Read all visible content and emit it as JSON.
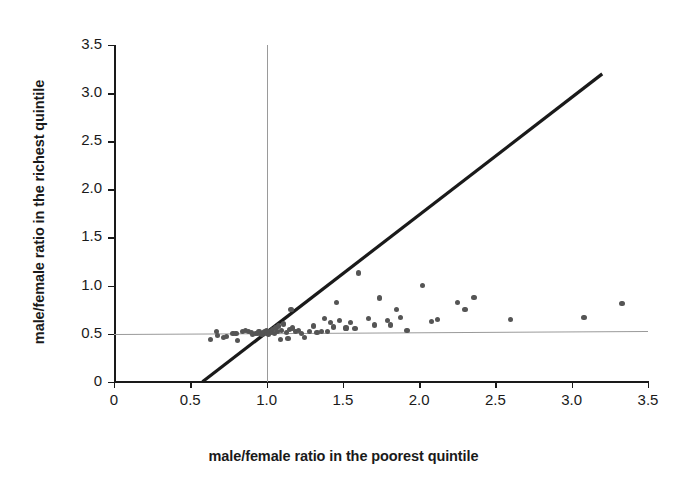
{
  "chart_data": {
    "type": "scatter",
    "title": "",
    "xlabel": "male/female ratio in the poorest quintile",
    "ylabel": "male/female ratio in the richest quintile",
    "xlim": [
      0,
      3.5
    ],
    "ylim": [
      0,
      3.5
    ],
    "xticks": [
      "0",
      "0.5",
      "1.0",
      "1.5",
      "2.0",
      "2.5",
      "3.0",
      "3.5"
    ],
    "xtick_values": [
      0,
      0.5,
      1.0,
      1.5,
      2.0,
      2.5,
      3.0,
      3.5
    ],
    "yticks": [
      "0",
      "0.5",
      "1.0",
      "1.5",
      "2.0",
      "2.5",
      "3.0",
      "3.5"
    ],
    "ytick_values": [
      0,
      0.5,
      1.0,
      1.5,
      2.0,
      2.5,
      3.0,
      3.5
    ],
    "grid": false,
    "legend": "none",
    "marker_color": "#555555",
    "marker_size": 5.2,
    "reference_lines": [
      {
        "name": "identity-line",
        "description": "y = x diagonal reference line",
        "type": "diagonal",
        "from": [
          0.58,
          0.0
        ],
        "to": [
          3.2,
          3.2
        ],
        "color": "#1a1a1a",
        "width": 3.2
      },
      {
        "name": "horizontal-reference",
        "description": "near-horizontal regression / reference line at about y = 0.5",
        "type": "horizontal",
        "from": [
          0.0,
          0.5
        ],
        "to": [
          3.5,
          0.53
        ],
        "color": "#9a9a9a",
        "width": 1
      },
      {
        "name": "vertical-reference",
        "description": "vertical reference line at x = 1.0",
        "type": "vertical",
        "x": 1.0,
        "from_y": 0.0,
        "to_y": 3.5,
        "color": "#9a9a9a",
        "width": 1
      }
    ],
    "points": [
      [
        0.63,
        0.44
      ],
      [
        0.67,
        0.52
      ],
      [
        0.68,
        0.48
      ],
      [
        0.72,
        0.46
      ],
      [
        0.74,
        0.47
      ],
      [
        0.78,
        0.5
      ],
      [
        0.8,
        0.5
      ],
      [
        0.81,
        0.43
      ],
      [
        0.84,
        0.52
      ],
      [
        0.86,
        0.53
      ],
      [
        0.88,
        0.52
      ],
      [
        0.9,
        0.51
      ],
      [
        0.91,
        0.49
      ],
      [
        0.93,
        0.5
      ],
      [
        0.94,
        0.5
      ],
      [
        0.95,
        0.52
      ],
      [
        0.96,
        0.5
      ],
      [
        0.97,
        0.49
      ],
      [
        0.98,
        0.51
      ],
      [
        0.99,
        0.52
      ],
      [
        1.0,
        0.5
      ],
      [
        1.0,
        0.53
      ],
      [
        1.01,
        0.49
      ],
      [
        1.02,
        0.52
      ],
      [
        1.03,
        0.51
      ],
      [
        1.04,
        0.54
      ],
      [
        1.05,
        0.5
      ],
      [
        1.06,
        0.56
      ],
      [
        1.07,
        0.52
      ],
      [
        1.08,
        0.58
      ],
      [
        1.09,
        0.44
      ],
      [
        1.1,
        0.53
      ],
      [
        1.11,
        0.6
      ],
      [
        1.13,
        0.51
      ],
      [
        1.14,
        0.45
      ],
      [
        1.15,
        0.54
      ],
      [
        1.16,
        0.75
      ],
      [
        1.17,
        0.56
      ],
      [
        1.19,
        0.52
      ],
      [
        1.21,
        0.53
      ],
      [
        1.23,
        0.5
      ],
      [
        1.25,
        0.46
      ],
      [
        1.28,
        0.52
      ],
      [
        1.31,
        0.58
      ],
      [
        1.33,
        0.51
      ],
      [
        1.36,
        0.52
      ],
      [
        1.38,
        0.66
      ],
      [
        1.4,
        0.52
      ],
      [
        1.42,
        0.62
      ],
      [
        1.44,
        0.57
      ],
      [
        1.46,
        0.82
      ],
      [
        1.48,
        0.64
      ],
      [
        1.52,
        0.56
      ],
      [
        1.55,
        0.62
      ],
      [
        1.58,
        0.55
      ],
      [
        1.6,
        1.13
      ],
      [
        1.67,
        0.66
      ],
      [
        1.71,
        0.59
      ],
      [
        1.74,
        0.87
      ],
      [
        1.79,
        0.64
      ],
      [
        1.81,
        0.59
      ],
      [
        1.85,
        0.75
      ],
      [
        1.88,
        0.67
      ],
      [
        1.92,
        0.53
      ],
      [
        2.02,
        1.0
      ],
      [
        2.08,
        0.63
      ],
      [
        2.12,
        0.65
      ],
      [
        2.25,
        0.82
      ],
      [
        2.3,
        0.75
      ],
      [
        2.36,
        0.88
      ],
      [
        2.6,
        0.65
      ],
      [
        3.08,
        0.67
      ],
      [
        3.33,
        0.81
      ]
    ]
  }
}
